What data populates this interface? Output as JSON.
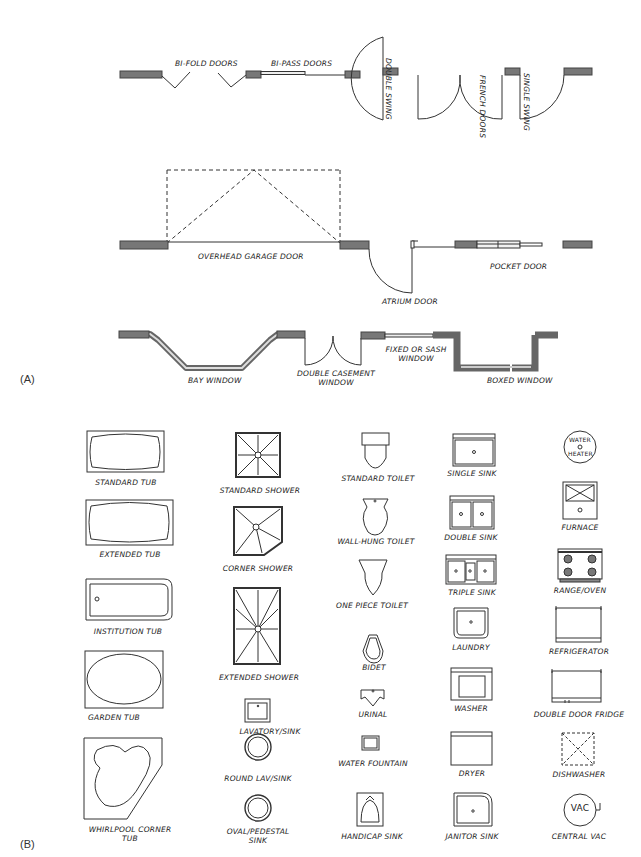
{
  "panels": {
    "a": {
      "label": "(A)",
      "symbols": [
        {
          "id": "bi-fold",
          "label": "BI-FOLD DOORS"
        },
        {
          "id": "bi-pass",
          "label": "BI-PASS DOORS"
        },
        {
          "id": "double-swing",
          "label": "DOUBLE SWING"
        },
        {
          "id": "french",
          "label": "FRENCH DOORS"
        },
        {
          "id": "single-swing",
          "label": "SINGLE SWING"
        },
        {
          "id": "garage",
          "label": "OVERHEAD GARAGE DOOR"
        },
        {
          "id": "atrium",
          "label": "ATRIUM DOOR"
        },
        {
          "id": "pocket",
          "label": "POCKET DOOR"
        },
        {
          "id": "bay",
          "label": "BAY WINDOW"
        },
        {
          "id": "casement",
          "label": "DOUBLE CASEMENT WINDOW"
        },
        {
          "id": "fixed",
          "label": "FIXED OR SASH WINDOW"
        },
        {
          "id": "boxed",
          "label": "BOXED WINDOW"
        }
      ]
    },
    "b": {
      "label": "(B)",
      "columns": [
        [
          "STANDARD TUB",
          "EXTENDED TUB",
          "INSTITUTION TUB",
          "GARDEN TUB",
          "WHIRLPOOL CORNER TUB"
        ],
        [
          "STANDARD SHOWER",
          "CORNER SHOWER",
          "EXTENDED SHOWER",
          "LAVATORY/SINK",
          "ROUND LAV/SINK",
          "OVAL/PEDESTAL SINK"
        ],
        [
          "STANDARD TOILET",
          "WALL-HUNG TOILET",
          "ONE PIECE TOILET",
          "BIDET",
          "URINAL",
          "WATER FOUNTAIN",
          "HANDICAP SINK"
        ],
        [
          "SINGLE SINK",
          "DOUBLE SINK",
          "TRIPLE SINK",
          "LAUNDRY",
          "WASHER",
          "DRYER",
          "JANITOR SINK"
        ],
        [
          "FURNACE",
          "RANGE/OVEN",
          "REFRIGERATOR",
          "DOUBLE DOOR FRIDGE",
          "DISHWASHER",
          "CENTRAL VAC"
        ]
      ],
      "water_heater_text": [
        "WATER",
        "HEATER"
      ],
      "vac_text": "VAC"
    }
  },
  "colors": {
    "line": "#333333",
    "wall": "#6e6e6e",
    "wall_dark": "#4a4a4a"
  }
}
